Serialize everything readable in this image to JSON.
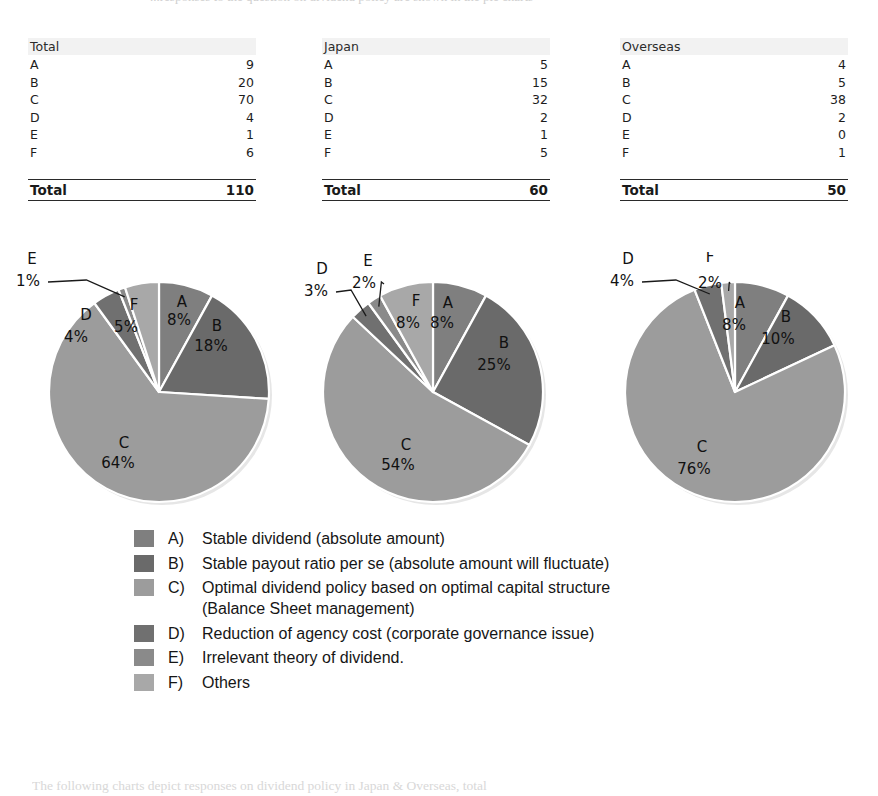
{
  "top_clipped_text": "...responses to the question on dividend policy are shown in the pie charts",
  "tables": [
    {
      "header": "Total",
      "rows": [
        {
          "cat": "A",
          "val": "9"
        },
        {
          "cat": "B",
          "val": "20"
        },
        {
          "cat": "C",
          "val": "70"
        },
        {
          "cat": "D",
          "val": "4"
        },
        {
          "cat": "E",
          "val": "1"
        },
        {
          "cat": "F",
          "val": "6"
        }
      ],
      "total_label": "Total",
      "total_value": "110"
    },
    {
      "header": "Japan",
      "rows": [
        {
          "cat": "A",
          "val": "5"
        },
        {
          "cat": "B",
          "val": "15"
        },
        {
          "cat": "C",
          "val": "32"
        },
        {
          "cat": "D",
          "val": "2"
        },
        {
          "cat": "E",
          "val": "1"
        },
        {
          "cat": "F",
          "val": "5"
        }
      ],
      "total_label": "Total",
      "total_value": "60"
    },
    {
      "header": "Overseas",
      "rows": [
        {
          "cat": "A",
          "val": "4"
        },
        {
          "cat": "B",
          "val": "5"
        },
        {
          "cat": "C",
          "val": "38"
        },
        {
          "cat": "D",
          "val": "2"
        },
        {
          "cat": "E",
          "val": "0"
        },
        {
          "cat": "F",
          "val": "1"
        }
      ],
      "total_label": "Total",
      "total_value": "50"
    }
  ],
  "colors": {
    "A": "#7f7f7f",
    "B": "#6a6a6a",
    "C": "#9c9c9c",
    "D": "#707070",
    "E": "#8a8a8a",
    "F": "#a8a8a8",
    "slice_border": "#ffffff",
    "leader_line": "#1a1a1a",
    "header_band": "#f2f2f2",
    "rule": "#2a2a2a"
  },
  "legend": {
    "items": [
      {
        "key": "A)",
        "color_ref": "A",
        "text": "Stable dividend (absolute amount)",
        "cont": ""
      },
      {
        "key": "B)",
        "color_ref": "B",
        "text": "Stable payout ratio per se (absolute amount will fluctuate)",
        "cont": ""
      },
      {
        "key": "C)",
        "color_ref": "C",
        "text": "Optimal dividend policy based on optimal capital structure",
        "cont": "(Balance Sheet management)"
      },
      {
        "key": "D)",
        "color_ref": "D",
        "text": "Reduction of agency cost (corporate governance issue)",
        "cont": ""
      },
      {
        "key": "E)",
        "color_ref": "E",
        "text": "Irrelevant theory of dividend.",
        "cont": ""
      },
      {
        "key": "F)",
        "color_ref": "F",
        "text": "Others",
        "cont": ""
      }
    ]
  },
  "bottom_caption": "The following charts depict responses on dividend policy in Japan & Overseas, total",
  "chart_data": [
    {
      "type": "pie",
      "title": "Total",
      "categories": [
        "A",
        "B",
        "C",
        "D",
        "E",
        "F"
      ],
      "values": [
        8,
        18,
        64,
        4,
        1,
        5
      ],
      "labels": [
        "A 8%",
        "B 18%",
        "C 64%",
        "D 4%",
        "E 1%",
        "F 5%"
      ],
      "counts": [
        9,
        20,
        70,
        4,
        1,
        6
      ],
      "total": 110,
      "unit": "%",
      "legend_position": "bottom-shared",
      "callouts": [
        "E 1%"
      ]
    },
    {
      "type": "pie",
      "title": "Japan",
      "categories": [
        "A",
        "B",
        "C",
        "D",
        "E",
        "F"
      ],
      "values": [
        8,
        25,
        54,
        3,
        2,
        8
      ],
      "labels": [
        "A 8%",
        "B 25%",
        "C 54%",
        "D 3%",
        "E 2%",
        "F 8%"
      ],
      "counts": [
        5,
        15,
        32,
        2,
        1,
        5
      ],
      "total": 60,
      "unit": "%",
      "legend_position": "bottom-shared",
      "callouts": [
        "D 3%",
        "E 2%"
      ]
    },
    {
      "type": "pie",
      "title": "Overseas",
      "categories": [
        "A",
        "B",
        "C",
        "D",
        "E",
        "F"
      ],
      "values": [
        8,
        10,
        76,
        4,
        0,
        2
      ],
      "labels": [
        "A 8%",
        "B 10%",
        "C 76%",
        "D 4%",
        "E 0%",
        "F 2%"
      ],
      "counts": [
        4,
        5,
        38,
        2,
        0,
        1
      ],
      "total": 50,
      "unit": "%",
      "legend_position": "bottom-shared",
      "callouts": [
        "D 4%",
        "F 2%"
      ]
    }
  ],
  "pie_label_layout": [
    {
      "chart": 0,
      "inside": [
        {
          "name": "A",
          "x": 168,
          "y": 55,
          "pct_x": 165,
          "pct_y": 73
        },
        {
          "name": "B",
          "x": 203,
          "y": 79,
          "pct_x": 197,
          "pct_y": 99
        },
        {
          "name": "C",
          "x": 110,
          "y": 196,
          "pct_x": 104,
          "pct_y": 216
        },
        {
          "name": "D",
          "x": 72,
          "y": 68,
          "pct_x": 62,
          "pct_y": 90
        },
        {
          "name": "F",
          "x": 120,
          "y": 58,
          "pct_x": 112,
          "pct_y": 80
        }
      ],
      "outside": [
        {
          "name": "E",
          "x": 18,
          "y": 12,
          "pct_x": 14,
          "pct_y": 34
        }
      ]
    },
    {
      "chart": 1,
      "inside": [
        {
          "name": "A",
          "x": 160,
          "y": 56,
          "pct_x": 154,
          "pct_y": 76
        },
        {
          "name": "B",
          "x": 216,
          "y": 96,
          "pct_x": 206,
          "pct_y": 118
        },
        {
          "name": "C",
          "x": 118,
          "y": 198,
          "pct_x": 110,
          "pct_y": 218
        },
        {
          "name": "F",
          "x": 128,
          "y": 54,
          "pct_x": 120,
          "pct_y": 76
        }
      ],
      "outside": [
        {
          "name": "D",
          "x": 34,
          "y": 22,
          "pct_x": 28,
          "pct_y": 44
        },
        {
          "name": "E",
          "x": 80,
          "y": 14,
          "pct_x": 76,
          "pct_y": 36
        }
      ]
    },
    {
      "chart": 2,
      "inside": [
        {
          "name": "A",
          "x": 150,
          "y": 56,
          "pct_x": 144,
          "pct_y": 78
        },
        {
          "name": "B",
          "x": 196,
          "y": 70,
          "pct_x": 188,
          "pct_y": 92
        },
        {
          "name": "C",
          "x": 112,
          "y": 200,
          "pct_x": 104,
          "pct_y": 222
        }
      ],
      "outside": [
        {
          "name": "D",
          "x": 38,
          "y": 12,
          "pct_x": 32,
          "pct_y": 34
        },
        {
          "name": "F",
          "x": 120,
          "y": 10,
          "pct_x": 120,
          "pct_y": 36
        }
      ]
    }
  ]
}
